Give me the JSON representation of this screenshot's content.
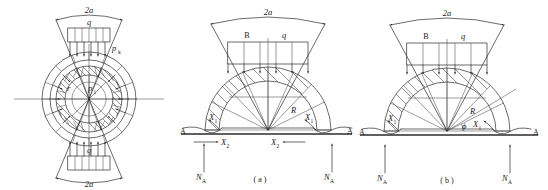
{
  "figure": {
    "panels": [
      {
        "id": "left",
        "caption": "",
        "labels": {
          "span_top": "2a",
          "span_bottom": "2a",
          "load_top": "q",
          "load_bottom": "q",
          "pressure_outer": "p",
          "pressure_outer_sub": "k",
          "pressure_inner": "p",
          "pressure_inner_sub": "1",
          "radius_inner": "r"
        }
      },
      {
        "id": "a",
        "caption": "( a )",
        "labels": {
          "span_top": "2a",
          "width_label": "B",
          "load_label": "q",
          "radius_label": "R",
          "ground_left": "A",
          "ground_right": "A",
          "thrust_h_left": "X",
          "thrust_h_left_sub": "1",
          "thrust_h_right": "X",
          "thrust_h_right_sub": "1",
          "thrust_v_left": "X",
          "thrust_v_left_sub": "2",
          "thrust_v_right": "X",
          "thrust_v_right_sub": "2",
          "reaction_left": "N",
          "reaction_left_sub": "A",
          "reaction_right": "N",
          "reaction_right_sub": "A"
        }
      },
      {
        "id": "b",
        "caption": "( b )",
        "labels": {
          "span_top": "2a",
          "width_label": "B",
          "load_label": "q",
          "radius_label": "R",
          "angle_label": "ϕ",
          "ground_left": "A",
          "ground_right": "A",
          "thrust_left": "X",
          "thrust_left_sub": "1",
          "thrust_right": "X",
          "thrust_right_sub": "1",
          "reaction_left": "N",
          "reaction_left_sub": "A",
          "reaction_right": "N",
          "reaction_right_sub": "A"
        }
      }
    ]
  }
}
